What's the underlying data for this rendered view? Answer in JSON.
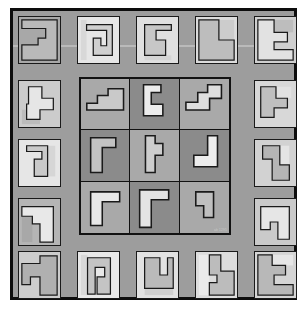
{
  "figure": {
    "watermark": "ab 1295"
  },
  "colors": {
    "page_background": "#ffffff",
    "frame_border": "#0d0d0d",
    "field_background": "#9d9d9d",
    "tile_outline": "#1a1a1a",
    "grid_outline": "#121212",
    "cell_light": "#a8a8a8",
    "cell_dark": "#8a8a8a",
    "shape_very_light": "#e8e8e8",
    "shape_light": "#d2d2d2",
    "shape_mid": "#b9b9b9",
    "shape_outline": "#1a1a1a"
  },
  "layout": {
    "frame": {
      "x": 10,
      "y": 8,
      "width": 287,
      "height": 292,
      "border": 3
    },
    "grid": {
      "x": 66,
      "y": 66,
      "width": 152,
      "height": 158,
      "rows": 3,
      "cols": 3
    },
    "border_tiles_total": 16,
    "top_row_count": 5,
    "bottom_row_count": 5,
    "left_column_count": 3,
    "right_column_count": 3
  },
  "border_tiles": [
    {
      "id": "top-1",
      "position": "top",
      "index": 1,
      "x": 18,
      "y": 16,
      "w": 43,
      "h": 48,
      "bg": "#a8a8a8",
      "shape_fill": "#b9b9b9",
      "path": "M3,3 L40,3 L40,45 L3,45 L3,29 L20,29 L20,22 L28,22 L28,12 L3,12 Z",
      "accent_path": "M28,3 L40,3 L40,45 L28,45 Z",
      "accent_fill": "#a0a0a0"
    },
    {
      "id": "top-2",
      "position": "top",
      "index": 2,
      "x": 77,
      "y": 16,
      "w": 43,
      "h": 48,
      "bg": "#e6e6e6",
      "shape_fill": "#cfcfcf",
      "path": "M9,8 L36,8 L36,40 L16,40 L16,22 L24,22 L24,30 L30,30 L30,14 L9,14 Z",
      "accent_path": "M3,3 L9,3 L9,45 L3,45 Z",
      "accent_fill": "#d8d8d8"
    },
    {
      "id": "top-3",
      "position": "top",
      "index": 3,
      "x": 136,
      "y": 16,
      "w": 43,
      "h": 48,
      "bg": "#e0e0e0",
      "shape_fill": "#c7c7c7",
      "path": "M8,8 L36,8 L36,14 L20,14 L20,24 L30,24 L30,40 L8,40 Z",
      "accent_path": "M8,40 L36,40 L36,45 L8,45 Z",
      "accent_fill": "#d4d4d4"
    },
    {
      "id": "top-4",
      "position": "top",
      "index": 4,
      "x": 195,
      "y": 16,
      "w": 43,
      "h": 48,
      "bg": "#dcdcdc",
      "shape_fill": "#bdbdbd",
      "path": "M3,3 L24,3 L24,24 L40,24 L40,45 L3,45 Z",
      "accent_path": "M24,3 L40,3 L40,24 L24,24 Z",
      "accent_fill": "#cccccc"
    },
    {
      "id": "top-5",
      "position": "top",
      "index": 5,
      "x": 254,
      "y": 16,
      "w": 43,
      "h": 48,
      "bg": "#cfcfcf",
      "shape_fill": "#e2e2e2",
      "path": "M3,3 L20,3 L20,16 L34,16 L34,26 L20,26 L20,34 L40,34 L40,45 L3,45 Z",
      "accent_path": "M20,3 L40,3 L40,16 L20,16 Z",
      "accent_fill": "#bdbdbd"
    },
    {
      "id": "left-1",
      "position": "left",
      "index": 1,
      "x": 18,
      "y": 80,
      "w": 43,
      "h": 48,
      "bg": "#cccccc",
      "shape_fill": "#e6e6e6",
      "path": "M10,6 L24,6 L24,18 L36,18 L36,30 L22,30 L22,40 L8,40 L8,24 L10,24 Z",
      "accent_path": "M3,30 L22,30 L22,45 L3,45 Z",
      "accent_fill": "#bcbcbc"
    },
    {
      "id": "left-2",
      "position": "left",
      "index": 2,
      "x": 18,
      "y": 139,
      "w": 43,
      "h": 48,
      "bg": "#e6e6e6",
      "shape_fill": "#c9c9c9",
      "path": "M8,6 L30,6 L30,38 L16,38 L16,20 L24,20 L24,12 L8,12 Z",
      "accent_path": "M30,6 L38,6 L38,38 L30,38 Z",
      "accent_fill": "#d6d6d6"
    },
    {
      "id": "left-3",
      "position": "left",
      "index": 3,
      "x": 18,
      "y": 198,
      "w": 43,
      "h": 48,
      "bg": "#b5b5b5",
      "shape_fill": "#e8e8e8",
      "path": "M3,8 L36,8 L36,45 L22,45 L22,26 L14,26 L14,18 L3,18 Z",
      "accent_path": "M3,18 L14,18 L14,45 L3,45 Z",
      "accent_fill": "#a8a8a8"
    },
    {
      "id": "right-1",
      "position": "right",
      "index": 1,
      "x": 254,
      "y": 80,
      "w": 43,
      "h": 48,
      "bg": "#d8d8d8",
      "shape_fill": "#bfbfbf",
      "path": "M6,6 L22,6 L22,18 L34,18 L34,28 L20,28 L20,38 L6,38 Z",
      "accent_path": "M22,6 L38,6 L38,18 L22,18 Z",
      "accent_fill": "#e2e2e2"
    },
    {
      "id": "right-2",
      "position": "right",
      "index": 2,
      "x": 254,
      "y": 139,
      "w": 43,
      "h": 48,
      "bg": "#d2d2d2",
      "shape_fill": "#b5b5b5",
      "path": "M8,6 L26,6 L26,26 L36,26 L36,42 L18,42 L18,20 L8,20 Z",
      "accent_path": "M26,6 L36,6 L36,26 L26,26 Z",
      "accent_fill": "#e4e4e4"
    },
    {
      "id": "right-3",
      "position": "right",
      "index": 3,
      "x": 254,
      "y": 198,
      "w": 43,
      "h": 48,
      "bg": "#cacaca",
      "shape_fill": "#e6e6e6",
      "path": "M6,8 L36,8 L36,42 L24,42 L24,24 L16,24 L16,32 L6,32 Z",
      "accent_path": "M24,24 L36,24 L36,42 L24,42 Z",
      "accent_fill": "#b4b4b4"
    },
    {
      "id": "bottom-1",
      "position": "bottom",
      "index": 1,
      "x": 18,
      "y": 251,
      "w": 43,
      "h": 48,
      "bg": "#cdcdcd",
      "shape_fill": "#b0b0b0",
      "path": "M3,12 L22,12 L22,4 L40,4 L40,45 L22,45 L22,26 L12,26 L12,34 L3,34 Z",
      "accent_path": "M3,12 L22,12 L22,26 L3,26 Z",
      "accent_fill": "#dddddd"
    },
    {
      "id": "bottom-2",
      "position": "bottom",
      "index": 2,
      "x": 77,
      "y": 251,
      "w": 43,
      "h": 48,
      "bg": "#e8e8e8",
      "shape_fill": "#c4c4c4",
      "path": "M10,6 L34,6 L34,44 L20,44 L20,26 L28,26 L28,16 L18,16 L18,44 L10,44 Z",
      "accent_path": "M3,3 L10,3 L10,45 L3,45 Z",
      "accent_fill": "#d8d8d8"
    },
    {
      "id": "bottom-3",
      "position": "bottom",
      "index": 3,
      "x": 136,
      "y": 251,
      "w": 43,
      "h": 48,
      "bg": "#e2e2e2",
      "shape_fill": "#bababa",
      "path": "M8,6 L24,6 L24,24 L32,24 L32,6 L38,6 L38,38 L8,38 Z",
      "accent_path": "M8,38 L38,38 L38,45 L8,45 Z",
      "accent_fill": "#d0d0d0"
    },
    {
      "id": "bottom-4",
      "position": "bottom",
      "index": 4,
      "x": 195,
      "y": 251,
      "w": 43,
      "h": 48,
      "bg": "#dddddd",
      "shape_fill": "#bcbcbc",
      "path": "M14,3 L26,3 L26,20 L40,20 L40,45 L14,45 L14,32 L22,32 L22,24 L14,24 Z",
      "accent_path": "M3,3 L14,3 L14,45 L3,45 Z",
      "accent_fill": "#eaeaea"
    },
    {
      "id": "bottom-5",
      "position": "bottom",
      "index": 5,
      "x": 254,
      "y": 251,
      "w": 43,
      "h": 48,
      "bg": "#d5d5d5",
      "shape_fill": "#b8b8b8",
      "path": "M3,3 L18,3 L18,14 L32,14 L32,24 L20,24 L20,34 L40,34 L40,45 L3,45 Z",
      "accent_path": "M18,3 L40,3 L40,14 L18,14 Z",
      "accent_fill": "#e6e6e6"
    }
  ],
  "center_cells": [
    {
      "id": "c-r1c1",
      "row": 1,
      "col": 1,
      "bg": "#a9a9a9",
      "shape_fill": "#c9c9c9",
      "shape_name": "stepped-z",
      "path": "M6,32 L6,25 L17,25 L17,17 L28,17 L28,10 L44,10 L44,32 Z"
    },
    {
      "id": "c-r1c2",
      "row": 1,
      "col": 2,
      "bg": "#8b8b8b",
      "shape_fill": "#ececec",
      "shape_name": "hook-left",
      "path": "M14,6 L32,6 L32,14 L22,14 L22,26 L34,26 L34,38 L14,38 Z"
    },
    {
      "id": "c-r1c3",
      "row": 1,
      "col": 3,
      "bg": "#a9a9a9",
      "shape_fill": "#dedede",
      "shape_name": "s-step",
      "path": "M6,24 L18,24 L18,14 L28,14 L28,6 L42,6 L42,20 L30,20 L30,32 L6,32 Z"
    },
    {
      "id": "c-r2c1",
      "row": 2,
      "col": 1,
      "bg": "#8b8b8b",
      "shape_fill": "#c2c2c2",
      "shape_name": "corner-L",
      "path": "M10,8 L36,8 L36,18 L22,18 L22,44 L10,44 Z"
    },
    {
      "id": "c-r2c2",
      "row": 2,
      "col": 2,
      "bg": "#a9a9a9",
      "shape_fill": "#cdcdcd",
      "shape_name": "flag",
      "path": "M16,6 L26,6 L26,14 L34,14 L34,26 L26,26 L26,44 L16,44 Z"
    },
    {
      "id": "c-r2c3",
      "row": 2,
      "col": 3,
      "bg": "#8b8b8b",
      "shape_fill": "#ececec",
      "shape_name": "J-hook",
      "path": "M28,6 L38,6 L38,38 L14,38 L14,26 L28,26 Z"
    },
    {
      "id": "c-r3c1",
      "row": 3,
      "col": 1,
      "bg": "#a9a9a9",
      "shape_fill": "#e8e8e8",
      "shape_name": "corner-L-wide",
      "path": "M10,10 L40,10 L40,20 L22,20 L22,44 L10,44 Z"
    },
    {
      "id": "c-r3c2",
      "row": 3,
      "col": 2,
      "bg": "#8b8b8b",
      "shape_fill": "#e4e4e4",
      "shape_name": "corner-L-tall",
      "path": "M10,8 L40,8 L40,18 L22,18 L22,46 L10,46 Z"
    },
    {
      "id": "c-r3c3",
      "row": 3,
      "col": 3,
      "bg": "#a9a9a9",
      "shape_fill": "#bfbfbf",
      "shape_name": "small-hook",
      "path": "M16,10 L34,10 L34,36 L24,36 L24,24 L16,24 Z"
    }
  ]
}
